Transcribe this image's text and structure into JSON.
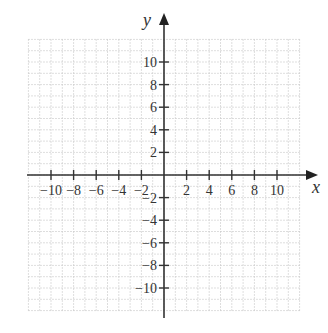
{
  "chart_data": {
    "type": "coordinate-plane",
    "title": "",
    "xlabel": "x",
    "ylabel": "y",
    "xlim": [
      -12,
      12
    ],
    "ylim": [
      -12,
      12
    ],
    "grid": true,
    "grid_style": "dotted",
    "grid_step": 1,
    "x_ticks": [
      -10,
      -8,
      -6,
      -4,
      -2,
      2,
      4,
      6,
      8,
      10
    ],
    "y_ticks": [
      10,
      8,
      6,
      4,
      2,
      -2,
      -4,
      -6,
      -8,
      -10
    ],
    "x_tick_labels": [
      "−10",
      "−8",
      "−6",
      "−4",
      "−2",
      "2",
      "4",
      "6",
      "8",
      "10"
    ],
    "y_tick_labels": [
      "10",
      "8",
      "6",
      "4",
      "2",
      "−2",
      "−4",
      "−6",
      "−8",
      "−10"
    ],
    "series": []
  },
  "colors": {
    "axis": "#333333",
    "grid": "#c8c8c8",
    "background": "#ffffff"
  }
}
